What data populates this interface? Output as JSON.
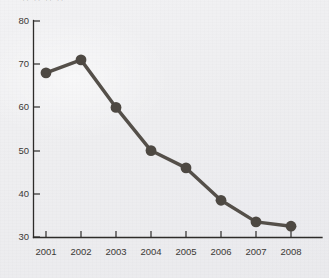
{
  "chart_data": {
    "type": "line",
    "title": "",
    "subtitle": "",
    "xlabel": "",
    "ylabel": "",
    "categories": [
      "2001",
      "2002",
      "2003",
      "2004",
      "2005",
      "2006",
      "2007",
      "2008"
    ],
    "values": [
      68,
      71,
      60,
      50,
      46,
      38.5,
      33.5,
      32.5
    ],
    "series": [
      {
        "name": "series-1",
        "values": [
          68,
          71,
          60,
          50,
          46,
          38.5,
          33.5,
          32.5
        ]
      }
    ],
    "xlim": [
      2000.5,
      2008.8
    ],
    "ylim": [
      30,
      80
    ],
    "yticks": [
      30,
      40,
      50,
      60,
      70,
      80
    ],
    "ytick_labels": [
      "30",
      "40",
      "50",
      "60",
      "70",
      "80"
    ],
    "xticks": [
      "2001",
      "2002",
      "2003",
      "2004",
      "2005",
      "2006",
      "2007",
      "2008"
    ],
    "grid": false,
    "legend": false,
    "legend_position": "none",
    "annotations": [],
    "marker": "circle",
    "colors": {
      "line": "#55504a",
      "marker": "#4e4943",
      "axis": "#2e2c2a",
      "tick_label": "#3b3936",
      "background": "#efeff1"
    }
  },
  "top_cropped_text": "·· ·· ·· ··"
}
